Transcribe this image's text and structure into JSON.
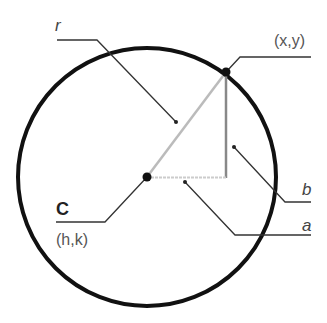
{
  "diagram": {
    "type": "circle-equation-geometry",
    "labels": {
      "radius": "r",
      "point": "(x,y)",
      "vertical_leg": "b",
      "horizontal_leg": "a",
      "center": "C",
      "center_coords": "(h,k)"
    },
    "colors": {
      "circle": "#111111",
      "radius_line": "#bbbbbb",
      "vertical_leg": "#888888",
      "horizontal_leg": "#cccccc",
      "leader_lines": "#333333",
      "label_text": "#555555"
    }
  }
}
